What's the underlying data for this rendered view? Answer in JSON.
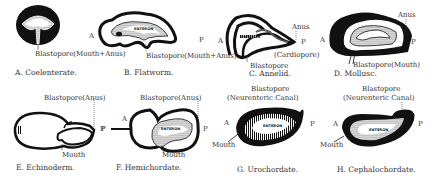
{
  "figure": {
    "panels": [
      {
        "id": "A",
        "caption": "A. Coelenterate.",
        "labels": {
          "blastopore": "Blastopore(Mouth+Anus)"
        }
      },
      {
        "id": "B",
        "caption": "B. Flatworm.",
        "labels": {
          "anterior": "A",
          "posterior": "P",
          "enteron": "ENTERON",
          "blastopore": "Blastopore(Mouth+Anus)"
        }
      },
      {
        "id": "C",
        "caption": "C. Annelid.",
        "labels": {
          "anterior": "A",
          "posterior": "P",
          "enteron": "ENTERON",
          "anus": "Anus",
          "blastopore": "Blastopore",
          "cardiopore": "(Cardiopore)"
        }
      },
      {
        "id": "D",
        "caption": "D. Mollusc.",
        "labels": {
          "anterior": "A",
          "posterior": "P",
          "anus": "Anus",
          "blastopore": "Blastopore(Mouth)"
        }
      },
      {
        "id": "E",
        "caption": "E. Echinoderm.",
        "labels": {
          "posterior": "P",
          "blastopore": "Blastopore(Anus)",
          "mouth": "Mouth"
        }
      },
      {
        "id": "F",
        "caption": "F. Hemichordate.",
        "labels": {
          "anterior": "A",
          "posterior_left": "P",
          "posterior": "P",
          "enteron": "ENTERON",
          "blastopore": "Blastopore(Anus)",
          "mouth": "Mouth"
        }
      },
      {
        "id": "G",
        "caption": "G. Urochordate.",
        "labels": {
          "anterior": "A",
          "posterior": "P",
          "enteron": "ENTERON",
          "blastopore_line1": "Blastopore",
          "blastopore_line2": "(Neurenteric Canal)",
          "mouth": "Mouth"
        }
      },
      {
        "id": "H",
        "caption": "H. Cephalochordate.",
        "labels": {
          "anterior": "A",
          "posterior": "P",
          "enteron": "ENTERON",
          "blastopore_line1": "Blastopore",
          "blastopore_line2": "(Neurenteric Canal)",
          "mouth": "Mouth"
        }
      }
    ]
  }
}
